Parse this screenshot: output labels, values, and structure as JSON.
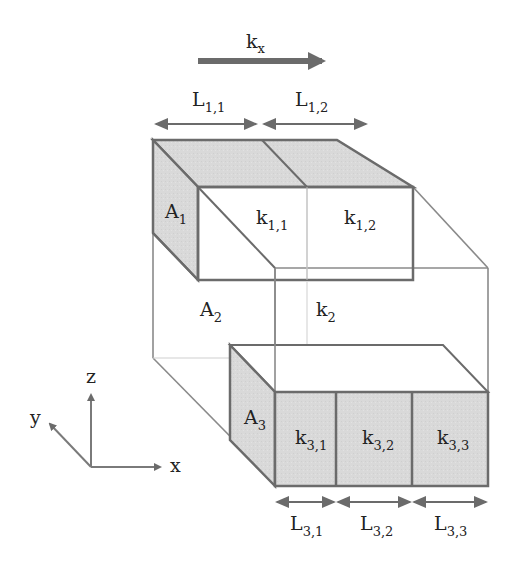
{
  "diagram": {
    "flow_label": {
      "base": "k",
      "sub": "x"
    },
    "colors": {
      "shaded_fill": "#d9d9d9",
      "edge": "#6b6b6b",
      "thin_edge": "#9a9a9a",
      "faint_edge": "#c8c8c8",
      "arrow": "#6b6b6b",
      "text": "#222222"
    },
    "top_lengths": [
      {
        "base": "L",
        "sub": "1,1"
      },
      {
        "base": "L",
        "sub": "1,2"
      }
    ],
    "bottom_lengths": [
      {
        "base": "L",
        "sub": "3,1"
      },
      {
        "base": "L",
        "sub": "3,2"
      },
      {
        "base": "L",
        "sub": "3,3"
      }
    ],
    "areas": [
      {
        "base": "A",
        "sub": "1"
      },
      {
        "base": "A",
        "sub": "2"
      },
      {
        "base": "A",
        "sub": "3"
      }
    ],
    "permeabilities": {
      "top": [
        {
          "base": "k",
          "sub": "1,1"
        },
        {
          "base": "k",
          "sub": "1,2"
        }
      ],
      "middle": {
        "base": "k",
        "sub": "2"
      },
      "bottom": [
        {
          "base": "k",
          "sub": "3,1"
        },
        {
          "base": "k",
          "sub": "3,2"
        },
        {
          "base": "k",
          "sub": "3,3"
        }
      ]
    },
    "axes": {
      "x": "x",
      "y": "y",
      "z": "z"
    }
  }
}
